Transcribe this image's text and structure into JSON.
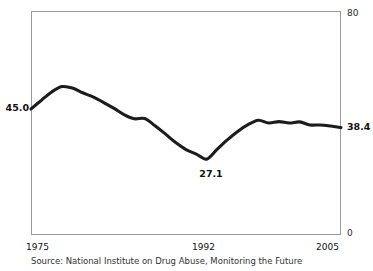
{
  "chart_data": {
    "type": "line",
    "title": "",
    "subtitle": "",
    "xlabel": "",
    "ylabel": "",
    "xlim": [
      1975,
      2005
    ],
    "ylim": [
      0,
      80
    ],
    "grid": false,
    "legend": null,
    "x_tick_labels": [
      "1975",
      "1992",
      "2005"
    ],
    "x_ticks": [
      1975,
      1992,
      2005
    ],
    "y_axis_left_labels": [
      "45.0"
    ],
    "y_axis_right_labels": [
      "80",
      "38.4",
      "0"
    ],
    "y_top_label": "80",
    "y_bottom_label": "0",
    "start_value_label": "45.0",
    "end_value_label": "38.4",
    "annotations": [
      {
        "label": "27.1",
        "x": 1992,
        "y": 27.1
      }
    ],
    "series": [
      {
        "name": "Past-year illicit drug use, 12th graders (%)",
        "x": [
          1975,
          1976,
          1977,
          1978,
          1979,
          1980,
          1981,
          1982,
          1983,
          1984,
          1985,
          1986,
          1987,
          1988,
          1989,
          1990,
          1991,
          1992,
          1993,
          1994,
          1995,
          1996,
          1997,
          1998,
          1999,
          2000,
          2001,
          2002,
          2003,
          2004,
          2005
        ],
        "values": [
          45.0,
          48.1,
          51.1,
          53.0,
          52.5,
          50.8,
          49.3,
          47.4,
          45.3,
          43.0,
          41.5,
          41.6,
          39.0,
          36.1,
          33.0,
          30.5,
          28.9,
          27.1,
          30.6,
          34.0,
          37.0,
          39.4,
          41.0,
          40.0,
          40.5,
          40.0,
          40.4,
          39.3,
          39.3,
          38.9,
          38.4
        ]
      }
    ]
  },
  "axis": {
    "left_value": "45.0",
    "right_value": "38.4",
    "top_value": "80",
    "bottom_value": "0"
  },
  "annotation": {
    "trough_value": "27.1"
  },
  "xticks": {
    "first": "1975",
    "middle": "1992",
    "last": "2005"
  },
  "footer": {
    "source": "Source: National Institute on Drug Abuse, Monitoring the Future"
  },
  "colors": {
    "line": "#1c1c1c",
    "frame": "#9a9a9a",
    "background": "#ffffff",
    "text": "#111111"
  }
}
